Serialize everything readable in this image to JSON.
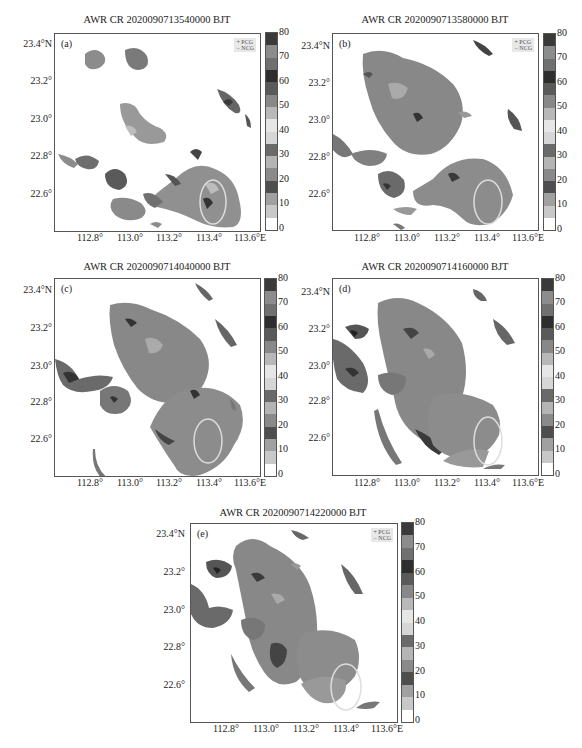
{
  "colorbar": {
    "ticks": [
      "80",
      "70",
      "60",
      "50",
      "40",
      "30",
      "20",
      "10",
      "0"
    ],
    "band_colors": [
      "#ffffff",
      "#c8c8c8",
      "#a0a0a0",
      "#4e4e4e",
      "#8a8a8a",
      "#b4b4b4",
      "#6a6a6a",
      "#d6d6d6",
      "#e6e6e6",
      "#b8b8b8",
      "#888888",
      "#5a5a5a",
      "#2e2e2e",
      "#707070",
      "#8c8c8c",
      "#3a3a3a"
    ]
  },
  "legend": {
    "pcg": "+ PCG",
    "ncg": "− NCG"
  },
  "y_ticks": [
    "23.4°N",
    "23.2°",
    "23.0°",
    "22.8°",
    "22.6°"
  ],
  "x_ticks": [
    "112.8°",
    "113.0°",
    "113.2°",
    "113.4°",
    "113.6°E"
  ],
  "panels": [
    {
      "label": "(a)",
      "title": "AWR CR 2020090713540000 BJT",
      "legend": true
    },
    {
      "label": "(b)",
      "title": "AWR CR 2020090713580000 BJT",
      "legend": true
    },
    {
      "label": "(c)",
      "title": "AWR CR 2020090714040000 BJT",
      "legend": false
    },
    {
      "label": "(d)",
      "title": "AWR CR 2020090714160000 BJT",
      "legend": false
    },
    {
      "label": "(e)",
      "title": "AWR CR 2020090714220000 BJT",
      "legend": true
    }
  ],
  "chart_data": [
    {
      "type": "heatmap",
      "title": "AWR CR 2020090713540000 BJT",
      "panel": "(a)",
      "xlabel": "Longitude",
      "ylabel": "Latitude",
      "x_ticks": [
        112.8,
        113.0,
        113.2,
        113.4,
        113.6
      ],
      "y_ticks": [
        22.6,
        22.8,
        23.0,
        23.2,
        23.4
      ],
      "colorbar": {
        "label": "dBZ",
        "range": [
          0,
          80
        ],
        "step": 5,
        "ticks": [
          0,
          10,
          20,
          30,
          40,
          50,
          60,
          70,
          80
        ]
      },
      "legend": [
        "PCG",
        "NCG"
      ],
      "annotation": "ellipse near 113.4°E, 22.55°N"
    },
    {
      "type": "heatmap",
      "title": "AWR CR 2020090713580000 BJT",
      "panel": "(b)",
      "xlabel": "Longitude",
      "ylabel": "Latitude",
      "x_ticks": [
        112.8,
        113.0,
        113.2,
        113.4,
        113.6
      ],
      "y_ticks": [
        22.6,
        22.8,
        23.0,
        23.2,
        23.4
      ],
      "colorbar": {
        "label": "dBZ",
        "range": [
          0,
          80
        ],
        "step": 5,
        "ticks": [
          0,
          10,
          20,
          30,
          40,
          50,
          60,
          70,
          80
        ]
      },
      "legend": [
        "PCG",
        "NCG"
      ],
      "annotation": "ellipse near 113.4°E, 22.55°N"
    },
    {
      "type": "heatmap",
      "title": "AWR CR 2020090714040000 BJT",
      "panel": "(c)",
      "xlabel": "Longitude",
      "ylabel": "Latitude",
      "x_ticks": [
        112.8,
        113.0,
        113.2,
        113.4,
        113.6
      ],
      "y_ticks": [
        22.6,
        22.8,
        23.0,
        23.2,
        23.4
      ],
      "colorbar": {
        "label": "dBZ",
        "range": [
          0,
          80
        ],
        "step": 5,
        "ticks": [
          0,
          10,
          20,
          30,
          40,
          50,
          60,
          70,
          80
        ]
      },
      "annotation": "ellipse near 113.4°E, 22.55°N"
    },
    {
      "type": "heatmap",
      "title": "AWR CR 2020090714160000 BJT",
      "panel": "(d)",
      "xlabel": "Longitude",
      "ylabel": "Latitude",
      "x_ticks": [
        112.8,
        113.0,
        113.2,
        113.4,
        113.6
      ],
      "y_ticks": [
        22.6,
        22.8,
        23.0,
        23.2,
        23.4
      ],
      "colorbar": {
        "label": "dBZ",
        "range": [
          0,
          80
        ],
        "step": 5,
        "ticks": [
          0,
          10,
          20,
          30,
          40,
          50,
          60,
          70,
          80
        ]
      },
      "annotation": "ellipse near 113.4°E, 22.55°N"
    },
    {
      "type": "heatmap",
      "title": "AWR CR 2020090714220000 BJT",
      "panel": "(e)",
      "xlabel": "Longitude",
      "ylabel": "Latitude",
      "x_ticks": [
        112.8,
        113.0,
        113.2,
        113.4,
        113.6
      ],
      "y_ticks": [
        22.6,
        22.8,
        23.0,
        23.2,
        23.4
      ],
      "colorbar": {
        "label": "dBZ",
        "range": [
          0,
          80
        ],
        "step": 5,
        "ticks": [
          0,
          10,
          20,
          30,
          40,
          50,
          60,
          70,
          80
        ]
      },
      "legend": [
        "PCG",
        "NCG"
      ],
      "annotation": "ellipse near 113.4°E, 22.55°N"
    }
  ]
}
